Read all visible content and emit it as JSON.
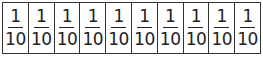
{
  "strip": {
    "cells": [
      {
        "numerator": "1",
        "denominator": "10"
      },
      {
        "numerator": "1",
        "denominator": "10"
      },
      {
        "numerator": "1",
        "denominator": "10"
      },
      {
        "numerator": "1",
        "denominator": "10"
      },
      {
        "numerator": "1",
        "denominator": "10"
      },
      {
        "numerator": "1",
        "denominator": "10"
      },
      {
        "numerator": "1",
        "denominator": "10"
      },
      {
        "numerator": "1",
        "denominator": "10"
      },
      {
        "numerator": "1",
        "denominator": "10"
      },
      {
        "numerator": "1",
        "denominator": "10"
      }
    ]
  }
}
